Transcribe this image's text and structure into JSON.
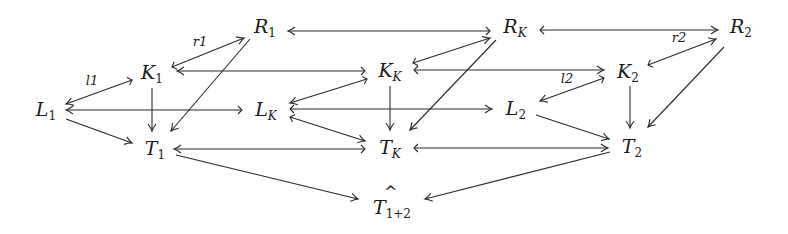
{
  "diagram": {
    "type": "commutative-diagram",
    "nodes": {
      "R1": {
        "base": "R",
        "sub": "1"
      },
      "RK": {
        "base": "R",
        "sub": "K"
      },
      "R2": {
        "base": "R",
        "sub": "2"
      },
      "K1": {
        "base": "K",
        "sub": "1"
      },
      "KK": {
        "base": "K",
        "sub": "K"
      },
      "K2": {
        "base": "K",
        "sub": "2"
      },
      "L1": {
        "base": "L",
        "sub": "1"
      },
      "LK": {
        "base": "L",
        "sub": "K"
      },
      "L2": {
        "base": "L",
        "sub": "2"
      },
      "T1": {
        "base": "T",
        "sub": "1"
      },
      "TK": {
        "base": "T",
        "sub": "K"
      },
      "T2": {
        "base": "T",
        "sub": "2"
      },
      "T12": {
        "base": "T",
        "sub": "1+2",
        "hat": "^"
      }
    },
    "edge_labels": {
      "r1": "r1",
      "l1": "l1",
      "l2": "l2",
      "r2": "r2"
    },
    "edges": [
      {
        "from": "K1",
        "to": "R1",
        "label": "r1",
        "type": "mono"
      },
      {
        "from": "K1",
        "to": "L1",
        "label": "l1",
        "type": "mono"
      },
      {
        "from": "RK",
        "to": "R1",
        "type": "mono"
      },
      {
        "from": "RK",
        "to": "R2",
        "type": "mono"
      },
      {
        "from": "KK",
        "to": "K1",
        "type": "mono"
      },
      {
        "from": "KK",
        "to": "K2",
        "label": "l2",
        "type": "mono"
      },
      {
        "from": "KK",
        "to": "RK",
        "type": "mono"
      },
      {
        "from": "KK",
        "to": "LK",
        "type": "mono"
      },
      {
        "from": "K2",
        "to": "R2",
        "label": "r2",
        "type": "mono"
      },
      {
        "from": "K2",
        "to": "L2",
        "type": "mono"
      },
      {
        "from": "LK",
        "to": "L1",
        "type": "mono"
      },
      {
        "from": "LK",
        "to": "L2",
        "type": "mono"
      },
      {
        "from": "LK",
        "to": "TK",
        "type": "mono"
      },
      {
        "from": "L1",
        "to": "T1"
      },
      {
        "from": "K1",
        "to": "T1"
      },
      {
        "from": "R1",
        "to": "T1"
      },
      {
        "from": "KK",
        "to": "TK"
      },
      {
        "from": "RK",
        "to": "TK"
      },
      {
        "from": "L2",
        "to": "T2"
      },
      {
        "from": "K2",
        "to": "T2"
      },
      {
        "from": "R2",
        "to": "T2"
      },
      {
        "from": "TK",
        "to": "T1",
        "type": "mono"
      },
      {
        "from": "TK",
        "to": "T2",
        "type": "mono"
      },
      {
        "from": "T1",
        "to": "T12"
      },
      {
        "from": "T2",
        "to": "T12"
      }
    ]
  }
}
